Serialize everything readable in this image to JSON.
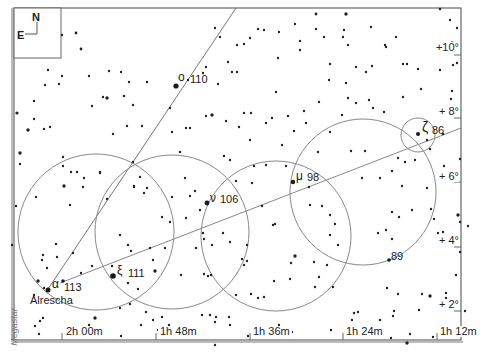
{
  "compass": {
    "north": "N",
    "east": "E"
  },
  "credit": "Megastar",
  "ra_labels": [
    "2h 00m",
    "1h 48m",
    "1h 36m",
    "1h 24m",
    "1h 12m"
  ],
  "dec_labels": [
    "+10°",
    "+ 8°",
    "+ 6°",
    "+ 4°",
    "+ 2°"
  ],
  "stars": {
    "omicron": {
      "greek": "ο",
      "flamsteed": "110"
    },
    "nu": {
      "greek": "ν",
      "flamsteed": "106"
    },
    "mu": {
      "greek": "μ",
      "flamsteed": "98"
    },
    "zeta": {
      "greek": "ζ",
      "flamsteed": "86"
    },
    "s89": {
      "flamsteed": "89"
    },
    "xi": {
      "greek": "ξ",
      "flamsteed": "111"
    },
    "alpha": {
      "greek": "α",
      "flamsteed": "113",
      "name": "Alrescha"
    }
  },
  "colors": {
    "frame": "#666666",
    "lines": "#777777",
    "stars": "#222222"
  }
}
